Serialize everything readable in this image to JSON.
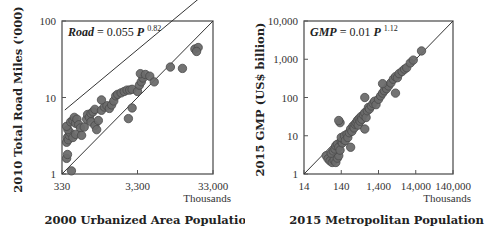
{
  "chart_data": [
    {
      "type": "scatter",
      "id": "left",
      "equation": {
        "lhs": "Road",
        "coef": "0.055",
        "var": "P",
        "exp": "0.82"
      },
      "xlabel": "2000 Urbanized Area Population",
      "xunit": "Thousands",
      "ylabel": "2010 Total Road Miles ('000)",
      "xscale": "log",
      "yscale": "log",
      "xlim": [
        330,
        33000
      ],
      "ylim": [
        1,
        100
      ],
      "xticks": [
        "330",
        "3,300",
        "33,000"
      ],
      "yticks": [
        "1",
        "10",
        "100"
      ],
      "lines": [
        "fit: Road = 0.055 P^0.82",
        "1:1 diagonal"
      ],
      "points": [
        [
          380,
          1.6
        ],
        [
          390,
          1.8
        ],
        [
          440,
          1.1
        ],
        [
          380,
          2.6
        ],
        [
          390,
          3.0
        ],
        [
          400,
          2.8
        ],
        [
          410,
          3.2
        ],
        [
          420,
          3.5
        ],
        [
          395,
          3.8
        ],
        [
          380,
          4.2
        ],
        [
          430,
          4.8
        ],
        [
          460,
          5.0
        ],
        [
          480,
          5.5
        ],
        [
          500,
          4.6
        ],
        [
          520,
          5.2
        ],
        [
          550,
          4.4
        ],
        [
          580,
          4.0
        ],
        [
          460,
          3.0
        ],
        [
          500,
          3.3
        ],
        [
          600,
          3.2
        ],
        [
          650,
          4.1
        ],
        [
          700,
          5.2
        ],
        [
          720,
          6.0
        ],
        [
          760,
          5.5
        ],
        [
          800,
          6.2
        ],
        [
          850,
          6.5
        ],
        [
          900,
          7.0
        ],
        [
          800,
          4.8
        ],
        [
          900,
          4.3
        ],
        [
          950,
          3.8
        ],
        [
          1000,
          5.0
        ],
        [
          1100,
          6.8
        ],
        [
          1200,
          7.5
        ],
        [
          1300,
          7.8
        ],
        [
          1400,
          7.2
        ],
        [
          1500,
          8.0
        ],
        [
          1600,
          9.0
        ],
        [
          1700,
          10.5
        ],
        [
          1800,
          11.0
        ],
        [
          2000,
          11.5
        ],
        [
          2200,
          12.0
        ],
        [
          2400,
          12.5
        ],
        [
          2600,
          12.5
        ],
        [
          2800,
          12.8
        ],
        [
          2500,
          5.3
        ],
        [
          2800,
          7.3
        ],
        [
          1100,
          9.3
        ],
        [
          3300,
          12.0
        ],
        [
          3500,
          14.5
        ],
        [
          3700,
          16.0
        ],
        [
          3900,
          18.0
        ],
        [
          3600,
          20.5
        ],
        [
          4200,
          20.0
        ],
        [
          4800,
          19.0
        ],
        [
          5500,
          16.0
        ],
        [
          9000,
          25.0
        ],
        [
          13000,
          24.0
        ],
        [
          19000,
          43.0
        ],
        [
          21000,
          45.0
        ],
        [
          20000,
          40.0
        ]
      ]
    },
    {
      "type": "scatter",
      "id": "right",
      "equation": {
        "lhs": "GMP",
        "coef": "0.01",
        "var": "P",
        "exp": "1.12"
      },
      "xlabel": "2015 Metropolitan Population",
      "xunit": "Thousands",
      "ylabel": "2015 GMP (US$ billion)",
      "xscale": "log",
      "yscale": "log",
      "xlim": [
        14,
        140000
      ],
      "ylim": [
        1,
        10000
      ],
      "xticks": [
        "14",
        "140",
        "1,400",
        "14,000",
        "140,000"
      ],
      "yticks": [
        "1",
        "10",
        "100",
        "1,000",
        "10,000"
      ],
      "lines": [
        "1:1 diagonal"
      ],
      "points": [
        [
          55,
          3.0
        ],
        [
          62,
          2.5
        ],
        [
          70,
          2.2
        ],
        [
          80,
          2.0
        ],
        [
          90,
          2.3
        ],
        [
          100,
          2.0
        ],
        [
          110,
          2.6
        ],
        [
          120,
          3.0
        ],
        [
          75,
          3.5
        ],
        [
          85,
          4.0
        ],
        [
          95,
          4.5
        ],
        [
          100,
          5.5
        ],
        [
          110,
          6.0
        ],
        [
          120,
          5.0
        ],
        [
          130,
          4.2
        ],
        [
          140,
          7.0
        ],
        [
          150,
          6.5
        ],
        [
          160,
          8.0
        ],
        [
          140,
          9.0
        ],
        [
          170,
          10.0
        ],
        [
          180,
          7.5
        ],
        [
          200,
          11.0
        ],
        [
          210,
          9.0
        ],
        [
          230,
          12.0
        ],
        [
          250,
          15.0
        ],
        [
          270,
          13.0
        ],
        [
          290,
          18.0
        ],
        [
          310,
          16.0
        ],
        [
          330,
          20.0
        ],
        [
          350,
          22.0
        ],
        [
          380,
          25.0
        ],
        [
          400,
          19.0
        ],
        [
          420,
          28.0
        ],
        [
          450,
          24.0
        ],
        [
          480,
          32.0
        ],
        [
          500,
          27.0
        ],
        [
          550,
          35.0
        ],
        [
          600,
          40.0
        ],
        [
          650,
          30.0
        ],
        [
          700,
          45.0
        ],
        [
          750,
          55.0
        ],
        [
          800,
          50.0
        ],
        [
          900,
          60.0
        ],
        [
          1000,
          70.0
        ],
        [
          1100,
          80.0
        ],
        [
          1200,
          65.0
        ],
        [
          1400,
          90.0
        ],
        [
          1600,
          110.0
        ],
        [
          1800,
          130.0
        ],
        [
          2000,
          150.0
        ],
        [
          2300,
          170.0
        ],
        [
          2600,
          200.0
        ],
        [
          3000,
          240.0
        ],
        [
          3500,
          300.0
        ],
        [
          4000,
          350.0
        ],
        [
          4500,
          330.0
        ],
        [
          5000,
          420.0
        ],
        [
          6000,
          480.0
        ],
        [
          7000,
          550.0
        ],
        [
          8000,
          600.0
        ],
        [
          10000,
          800.0
        ],
        [
          12000,
          950.0
        ],
        [
          20000,
          1650.0
        ],
        [
          130,
          22.0
        ],
        [
          600,
          100.0
        ],
        [
          1800,
          230.0
        ],
        [
          4000,
          130.0
        ],
        [
          600,
          15.0
        ],
        [
          250,
          5.0
        ],
        [
          120,
          25.0
        ]
      ]
    }
  ]
}
